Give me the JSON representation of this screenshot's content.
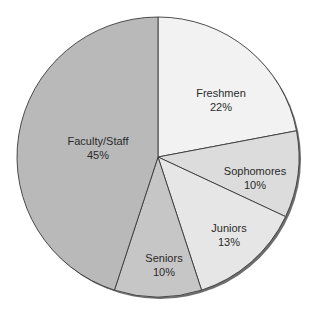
{
  "chart_data": {
    "type": "pie",
    "title": "",
    "start_angle_deg": 0,
    "direction": "clockwise",
    "categories": [
      "Freshmen",
      "Sophomores",
      "Juniors",
      "Seniors",
      "Faculty/Staff"
    ],
    "values": [
      22,
      10,
      13,
      10,
      45
    ],
    "labels": [
      "22%",
      "10%",
      "13%",
      "10%",
      "45%"
    ],
    "colors": [
      "#f2f2f2",
      "#dcdcdc",
      "#e6e6e6",
      "#c6c6c6",
      "#b9b9b9"
    ],
    "legend": "none",
    "data_labels": "inside"
  },
  "slices": [
    {
      "name": "Freshmen",
      "pct": "22%"
    },
    {
      "name": "Sophomores",
      "pct": "10%"
    },
    {
      "name": "Juniors",
      "pct": "13%"
    },
    {
      "name": "Seniors",
      "pct": "10%"
    },
    {
      "name": "Faculty/Staff",
      "pct": "45%"
    }
  ]
}
